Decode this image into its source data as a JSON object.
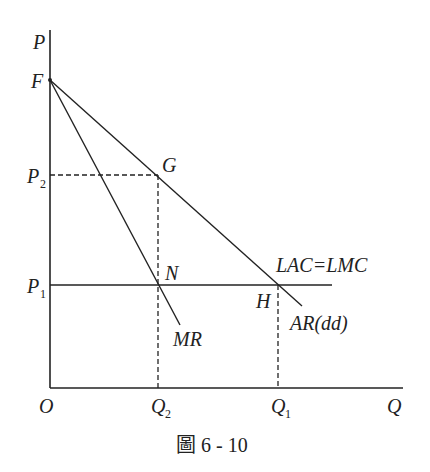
{
  "caption": "圖 6 - 10",
  "axes": {
    "y_label": "P",
    "x_label": "Q",
    "origin_label": "O"
  },
  "points": {
    "F": "F",
    "G": "G",
    "N": "N",
    "H": "H"
  },
  "price_labels": {
    "p2_main": "P",
    "p2_sub": "2",
    "p1_main": "P",
    "p1_sub": "1"
  },
  "quantity_labels": {
    "q2_main": "Q",
    "q2_sub": "2",
    "q1_main": "Q",
    "q1_sub": "1"
  },
  "curve_labels": {
    "cost": "LAC=LMC",
    "marginal_revenue": "MR",
    "average_revenue": "AR(dd)"
  },
  "colors": {
    "line": "#222222"
  }
}
